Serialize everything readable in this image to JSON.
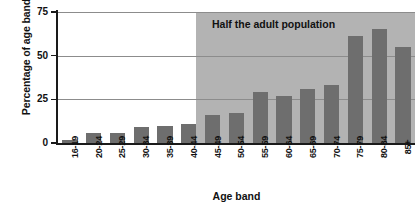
{
  "chart_data": {
    "type": "bar",
    "title": "",
    "xlabel": "Age band",
    "ylabel": "Percentage of age band",
    "categories": [
      "16-19",
      "20-24",
      "25-29",
      "30-34",
      "35-39",
      "40-44",
      "45-49",
      "50-54",
      "55-59",
      "60-64",
      "65-69",
      "70-74",
      "75-79",
      "80-84",
      "85+"
    ],
    "values": [
      2,
      6,
      6,
      9,
      10,
      11,
      16,
      17,
      29,
      27,
      31,
      33,
      61,
      65,
      55
    ],
    "ylim": [
      0,
      75
    ],
    "yticks": [
      "0",
      "25",
      "50",
      "75"
    ],
    "ytick_values": [
      0,
      25,
      50,
      75
    ],
    "grid": "horizontal",
    "legend": "none",
    "annotations": [
      {
        "text": "Half the adult population",
        "region_start_category": "45-49",
        "region_end_category": "85+"
      }
    ],
    "colors": {
      "bar": "#6e6e6e",
      "shaded_region": "#b3b3b3",
      "axis": "#1a1a1a",
      "gridline": "#8c8c8c",
      "background": "#ffffff"
    }
  }
}
